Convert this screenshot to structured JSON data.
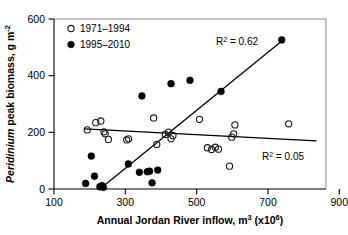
{
  "chart_data": {
    "type": "scatter",
    "title": "",
    "xlabel": "Annual Jordan River inflow, m3 (x106)",
    "xlabel_main": "Annual Jordan River inflow, m",
    "xlabel_sup1": "3",
    "xlabel_mid": " (x10",
    "xlabel_sup2": "6",
    "xlabel_end": ")",
    "ylabel": "Peridinium peak biomass, g m-2",
    "ylabel_italic": "Peridinium",
    "ylabel_rest": " peak biomass, g m",
    "ylabel_sup": "-2",
    "xlim": [
      100,
      960
    ],
    "ylim": [
      0,
      610
    ],
    "xticks": [
      100,
      300,
      500,
      700,
      900
    ],
    "xtick_labels": [
      "100",
      "300",
      "500",
      "700",
      "900"
    ],
    "yticks": [
      0,
      200,
      400,
      600
    ],
    "ytick_labels": [
      "0",
      "200",
      "400",
      "600"
    ],
    "grid": false,
    "legend_position": "top-left",
    "series": [
      {
        "name": "1971-1994",
        "marker": "open-circle",
        "color": "#1a1a1a",
        "points": [
          [
            205,
            212
          ],
          [
            232,
            238
          ],
          [
            248,
            244
          ],
          [
            258,
            205
          ],
          [
            262,
            198
          ],
          [
            272,
            178
          ],
          [
            330,
            176
          ],
          [
            336,
            180
          ],
          [
            415,
            255
          ],
          [
            425,
            160
          ],
          [
            452,
            196
          ],
          [
            462,
            204
          ],
          [
            470,
            180
          ],
          [
            476,
            192
          ],
          [
            560,
            250
          ],
          [
            585,
            148
          ],
          [
            598,
            142
          ],
          [
            610,
            150
          ],
          [
            620,
            143
          ],
          [
            655,
            82
          ],
          [
            662,
            186
          ],
          [
            668,
            198
          ],
          [
            672,
            230
          ],
          [
            842,
            234
          ]
        ]
      },
      {
        "name": "1995-2010",
        "marker": "filled-circle",
        "color": "#000000",
        "points": [
          [
            200,
            20
          ],
          [
            218,
            118
          ],
          [
            228,
            46
          ],
          [
            245,
            8
          ],
          [
            252,
            12
          ],
          [
            256,
            6
          ],
          [
            335,
            90
          ],
          [
            378,
            334
          ],
          [
            370,
            60
          ],
          [
            395,
            62
          ],
          [
            402,
            64
          ],
          [
            410,
            22
          ],
          [
            428,
            68
          ],
          [
            470,
            378
          ],
          [
            530,
            390
          ],
          [
            628,
            350
          ],
          [
            820,
            535
          ]
        ]
      }
    ],
    "fits": [
      {
        "name": "1971-1994 regression",
        "series": "1971-1994",
        "x_start": 196,
        "y_start": 216,
        "x_end": 930,
        "y_end": 173,
        "r2_label": "R2 = 0.05",
        "r2_prefix": "R",
        "r2_sup": "2",
        "r2_value": " = 0.05"
      },
      {
        "name": "1995-2010 regression",
        "series": "1995-2010",
        "x_start": 252,
        "y_start": 6,
        "x_end": 830,
        "y_end": 540,
        "r2_label": "R2 = 0.62",
        "r2_prefix": "R",
        "r2_sup": "2",
        "r2_value": " = 0.62"
      }
    ],
    "legend": [
      {
        "label": "1971–1994",
        "marker": "open-circle"
      },
      {
        "label": "1995–2010",
        "marker": "filled-circle"
      }
    ],
    "annotations": [
      {
        "name": "r2-filled",
        "text": "R2 = 0.62",
        "x": 500,
        "y": 480
      },
      {
        "name": "r2-open",
        "text": "R2 = 0.05",
        "x": 740,
        "y": 105
      }
    ]
  }
}
